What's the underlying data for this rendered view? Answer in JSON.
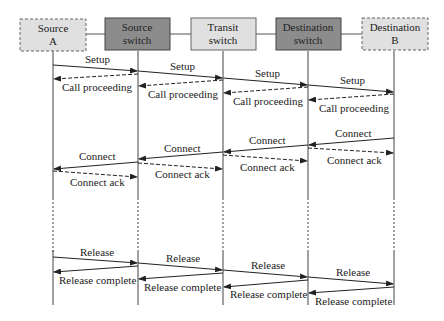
{
  "diagram": {
    "type": "sequence",
    "entities": [
      {
        "id": "srcA",
        "line1": "Source",
        "line2": "A",
        "style": "dashed-light",
        "fill": "#e0e0e0"
      },
      {
        "id": "srcSw",
        "line1": "Source",
        "line2": "switch",
        "style": "solid-dark",
        "fill": "#8c8c8c"
      },
      {
        "id": "trSw",
        "line1": "Transit",
        "line2": "switch",
        "style": "solid-light",
        "fill": "#e0e0e0"
      },
      {
        "id": "dstSw",
        "line1": "Destination",
        "line2": "switch",
        "style": "solid-dark",
        "fill": "#8c8c8c"
      },
      {
        "id": "dstB",
        "line1": "Destination",
        "line2": "B",
        "style": "dashed-light",
        "fill": "#e0e0e0"
      }
    ],
    "messages": [
      {
        "label": "Setup",
        "from": "srcA",
        "to": "srcSw",
        "style": "solid"
      },
      {
        "label": "Setup",
        "from": "srcSw",
        "to": "trSw",
        "style": "solid"
      },
      {
        "label": "Setup",
        "from": "trSw",
        "to": "dstSw",
        "style": "solid"
      },
      {
        "label": "Setup",
        "from": "dstSw",
        "to": "dstB",
        "style": "solid"
      },
      {
        "label": "Call proceeding",
        "from": "srcSw",
        "to": "srcA",
        "style": "dashed"
      },
      {
        "label": "Call proceeding",
        "from": "trSw",
        "to": "srcSw",
        "style": "dashed"
      },
      {
        "label": "Call proceeding",
        "from": "dstSw",
        "to": "trSw",
        "style": "dashed"
      },
      {
        "label": "Call proceeding",
        "from": "dstB",
        "to": "dstSw",
        "style": "dashed"
      },
      {
        "label": "Connect",
        "from": "dstB",
        "to": "dstSw",
        "style": "solid"
      },
      {
        "label": "Connect",
        "from": "dstSw",
        "to": "trSw",
        "style": "solid"
      },
      {
        "label": "Connect",
        "from": "trSw",
        "to": "srcSw",
        "style": "solid"
      },
      {
        "label": "Connect",
        "from": "srcSw",
        "to": "srcA",
        "style": "solid"
      },
      {
        "label": "Connect ack",
        "from": "dstSw",
        "to": "dstB",
        "style": "dashed"
      },
      {
        "label": "Connect ack",
        "from": "trSw",
        "to": "dstSw",
        "style": "dashed"
      },
      {
        "label": "Connect ack",
        "from": "srcSw",
        "to": "trSw",
        "style": "dashed"
      },
      {
        "label": "Connect ack",
        "from": "srcA",
        "to": "srcSw",
        "style": "dashed"
      },
      {
        "label": "Release",
        "from": "srcA",
        "to": "srcSw",
        "style": "solid"
      },
      {
        "label": "Release",
        "from": "srcSw",
        "to": "trSw",
        "style": "solid"
      },
      {
        "label": "Release",
        "from": "trSw",
        "to": "dstSw",
        "style": "solid"
      },
      {
        "label": "Release",
        "from": "dstSw",
        "to": "dstB",
        "style": "solid"
      },
      {
        "label": "Release complete",
        "from": "srcSw",
        "to": "srcA",
        "style": "solid"
      },
      {
        "label": "Release complete",
        "from": "trSw",
        "to": "srcSw",
        "style": "solid"
      },
      {
        "label": "Release complete",
        "from": "dstSw",
        "to": "trSw",
        "style": "solid"
      },
      {
        "label": "Release complete",
        "from": "dstB",
        "to": "dstSw",
        "style": "solid"
      }
    ]
  },
  "labels": {
    "setup": "Setup",
    "call_proceeding": "Call proceeding",
    "connect": "Connect",
    "connect_ack": "Connect ack",
    "release": "Release",
    "release_complete": "Release complete"
  }
}
